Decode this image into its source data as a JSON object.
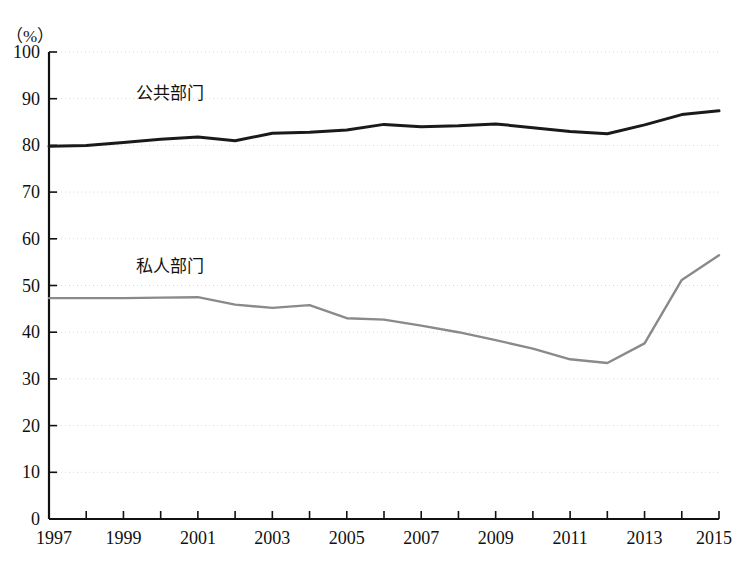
{
  "chart_data": {
    "type": "line",
    "title": "",
    "subtitle": "",
    "unit_label": "（%）",
    "xlabel": "",
    "ylabel": "",
    "xlim": [
      1997,
      2015
    ],
    "ylim": [
      0,
      100
    ],
    "grid": true,
    "legend_position": "inline-annotation",
    "x": [
      1997,
      1998,
      1999,
      2000,
      2001,
      2002,
      2003,
      2004,
      2005,
      2006,
      2007,
      2008,
      2009,
      2010,
      2011,
      2012,
      2013,
      2014,
      2015
    ],
    "xtick_labels": [
      "1997",
      "1999",
      "2001",
      "2003",
      "2005",
      "2007",
      "2009",
      "2011",
      "2013",
      "2015"
    ],
    "ytick_labels": [
      "0",
      "10",
      "20",
      "30",
      "40",
      "50",
      "60",
      "70",
      "80",
      "90",
      "100"
    ],
    "ytick_values": [
      0,
      10,
      20,
      30,
      40,
      50,
      60,
      70,
      80,
      90,
      100
    ],
    "series": [
      {
        "name": "公共部门",
        "color": "#1a1a1a",
        "label_x": 2001,
        "label_y": 91,
        "values": [
          79.8,
          80.0,
          80.6,
          81.3,
          81.8,
          81.0,
          82.6,
          82.8,
          83.3,
          84.5,
          84.0,
          84.2,
          84.6,
          83.8,
          83.0,
          82.5,
          84.4,
          86.6,
          87.4
        ]
      },
      {
        "name": "私人部门",
        "color": "#8a8a8a",
        "label_x": 2001,
        "label_y": 54,
        "values": [
          47.3,
          47.3,
          47.3,
          47.4,
          47.5,
          45.9,
          45.2,
          45.8,
          43.0,
          42.7,
          41.4,
          40.0,
          38.3,
          36.5,
          34.2,
          33.4,
          37.6,
          51.2,
          56.5
        ]
      }
    ]
  }
}
